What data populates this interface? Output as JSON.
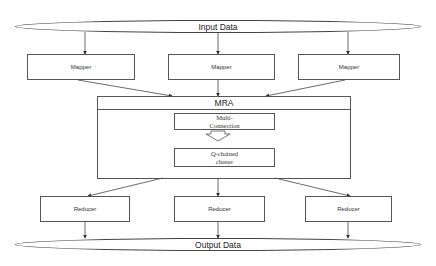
{
  "diagram": {
    "input": {
      "label": "Input Data"
    },
    "output": {
      "label": "Output Data"
    },
    "mappers": [
      {
        "label": "Mapper"
      },
      {
        "label": "Mapper"
      },
      {
        "label": "Mapper"
      }
    ],
    "mra": {
      "title": "MRA",
      "multi_connection": {
        "line1": "Multi-",
        "line2": "Connection"
      },
      "q_chained": {
        "line1": "Q-chained",
        "line2": "cluster"
      }
    },
    "reducers": [
      {
        "label": "Reducer"
      },
      {
        "label": "Reducer"
      },
      {
        "label": "Reducer"
      }
    ],
    "colors": {
      "stroke": "#555555",
      "background": "#ffffff",
      "text": "#222222"
    }
  }
}
